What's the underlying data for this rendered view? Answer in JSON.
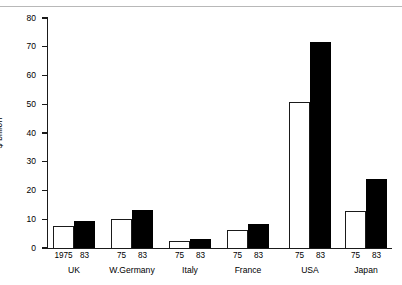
{
  "chart_data": {
    "type": "bar",
    "title": "",
    "xlabel": "",
    "ylabel": "$ billion",
    "ylim": [
      0,
      80
    ],
    "yticks": [
      0,
      10,
      20,
      30,
      40,
      50,
      60,
      70,
      80
    ],
    "grid": false,
    "legend": null,
    "categories": [
      "UK",
      "W.Germany",
      "Italy",
      "France",
      "USA",
      "Japan"
    ],
    "series": [
      {
        "name": "1975",
        "style": "open",
        "values": [
          7.7,
          10.1,
          2.5,
          6.1,
          50.8,
          12.9
        ]
      },
      {
        "name": "83",
        "style": "solid",
        "values": [
          9.4,
          13.3,
          3.1,
          8.5,
          71.6,
          24.0
        ]
      }
    ],
    "group_year_labels": [
      [
        "1975",
        "83"
      ],
      [
        "75",
        "83"
      ],
      [
        "75",
        "83"
      ],
      [
        "75",
        "83"
      ],
      [
        "75",
        "83"
      ],
      [
        "75",
        "83"
      ]
    ]
  },
  "axis": {
    "y_tick_0": "0",
    "y_tick_10": "10",
    "y_tick_20": "20",
    "y_tick_30": "30",
    "y_tick_40": "40",
    "y_tick_50": "50",
    "y_tick_60": "60",
    "y_tick_70": "70",
    "y_tick_80": "80",
    "y_title": "$ billion"
  },
  "groups": [
    {
      "label": "UK",
      "bar1_label": "1975",
      "bar2_label": "83",
      "bar1_value": 7.7,
      "bar2_value": 9.4
    },
    {
      "label": "W.Germany",
      "bar1_label": "75",
      "bar2_label": "83",
      "bar1_value": 10.1,
      "bar2_value": 13.3
    },
    {
      "label": "Italy",
      "bar1_label": "75",
      "bar2_label": "83",
      "bar1_value": 2.5,
      "bar2_value": 3.1
    },
    {
      "label": "France",
      "bar1_label": "75",
      "bar2_label": "83",
      "bar1_value": 6.1,
      "bar2_value": 8.5
    },
    {
      "label": "USA",
      "bar1_label": "75",
      "bar2_label": "83",
      "bar1_value": 50.8,
      "bar2_value": 71.6
    },
    {
      "label": "Japan",
      "bar1_label": "75",
      "bar2_label": "83",
      "bar1_value": 12.9,
      "bar2_value": 24.0
    }
  ],
  "colors": {
    "bar_open_fill": "#ffffff",
    "bar_solid_fill": "#000000",
    "axis": "#1a1a1a",
    "background": "#ffffff"
  }
}
